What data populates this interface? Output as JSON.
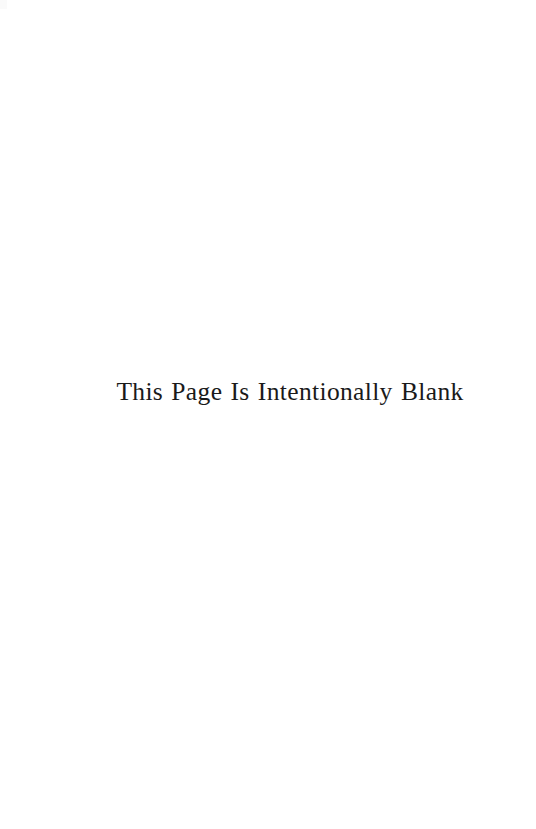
{
  "page": {
    "width": 536,
    "height": 829,
    "background_color": "#ffffff",
    "ink_color": "#1a1a1a",
    "kind": "scanned-book-page"
  },
  "content": {
    "notice_text": "This Page Is Intentionally Blank"
  },
  "artifacts": {
    "corner_smudge_color": "#fafafa"
  }
}
